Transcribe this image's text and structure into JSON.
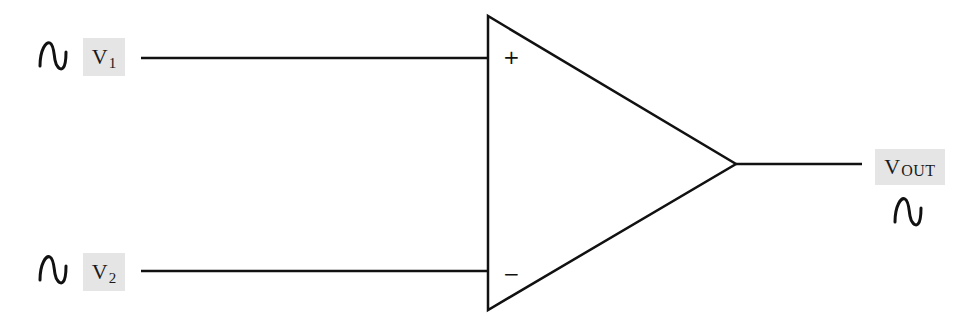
{
  "diagram": {
    "type": "operational-amplifier",
    "inputs": [
      {
        "id": "v1",
        "label_main": "V",
        "label_sub": "1",
        "terminal": "+",
        "source_icon": "sine-wave-icon"
      },
      {
        "id": "v2",
        "label_main": "V",
        "label_sub": "2",
        "terminal": "−",
        "source_icon": "sine-wave-icon"
      }
    ],
    "output": {
      "id": "vout",
      "label_main": "V",
      "label_sub": "OUT",
      "source_icon": "sine-wave-icon"
    },
    "colors": {
      "line": "#111111",
      "label_bg": "#e5e5e5",
      "background": "#ffffff"
    }
  }
}
